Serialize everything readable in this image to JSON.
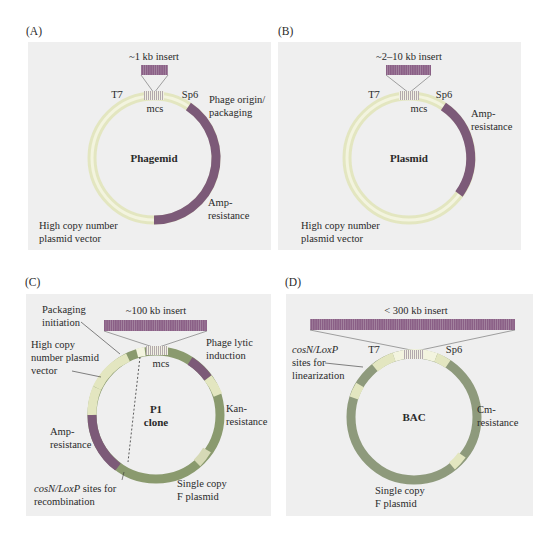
{
  "colors": {
    "panel_bg": "#efefef",
    "vector_ring": "#e6e9c4",
    "vector_ring_inner": "#f3f4df",
    "resistance_dark": "#7c5a78",
    "insert": "#8a5f86",
    "insert_ring_B": "#a06a98",
    "c_green": "#8a9a6e",
    "c_gray": "#c9c9c9",
    "bac_ring": "#8e9a7c",
    "text": "#2a2a2a"
  },
  "panels": [
    {
      "id": "A",
      "letter": "(A)",
      "title": "Phagemid",
      "insert_label": "~1 kb insert",
      "labels": {
        "t7": "T7",
        "sp6": "Sp6",
        "mcs": "mcs",
        "phage_origin_1": "Phage origin/",
        "phage_origin_2": "packaging",
        "amp_1": "Amp-",
        "amp_2": "resistance",
        "vector_1": "High copy number",
        "vector_2": "plasmid vector"
      }
    },
    {
      "id": "B",
      "letter": "(B)",
      "title": "Plasmid",
      "insert_label": "~2–10 kb insert",
      "labels": {
        "t7": "T7",
        "sp6": "Sp6",
        "mcs": "mcs",
        "amp_1": "Amp-",
        "amp_2": "resistance",
        "vector_1": "High copy number",
        "vector_2": "plasmid vector"
      }
    },
    {
      "id": "C",
      "letter": "(C)",
      "title_1": "P1",
      "title_2": "clone",
      "insert_label": "~100 kb insert",
      "labels": {
        "packaging_1": "Packaging",
        "packaging_2": "initiation",
        "vector_1": "High copy",
        "vector_2": "number plasmid",
        "vector_3": "vector",
        "mcs": "mcs",
        "lytic_1": "Phage lytic",
        "lytic_2": "induction",
        "kan_1": "Kan-",
        "kan_2": "resistance",
        "amp_1": "Amp-",
        "amp_2": "resistance",
        "cos_ital": "cosN/LoxP",
        "cos_rest": " sites for",
        "cos_2": "recombination",
        "fplasmid_1": "Single copy",
        "fplasmid_2": "F plasmid"
      }
    },
    {
      "id": "D",
      "letter": "(D)",
      "title": "BAC",
      "insert_label": "< 300 kb insert",
      "labels": {
        "cos_ital": "cosN/LoxP",
        "cos_2": "sites for",
        "cos_3": "linearization",
        "t7": "T7",
        "sp6": "Sp6",
        "cm_1": "Cm-",
        "cm_2": "resistance",
        "fplasmid_1": "Single copy",
        "fplasmid_2": "F plasmid"
      }
    }
  ]
}
